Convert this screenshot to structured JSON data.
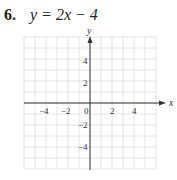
{
  "problem": {
    "number": "6.",
    "equation": "y = 2x − 4"
  },
  "chart_data": {
    "type": "line",
    "title": "y = 2x − 4",
    "xlabel": "x",
    "ylabel": "y",
    "xlim": [
      -6,
      6
    ],
    "ylim": [
      -6,
      6
    ],
    "grid": true,
    "x_ticks": [
      "−4",
      "−2",
      "0",
      "2",
      "4"
    ],
    "y_ticks": [
      "4",
      "2",
      "−2",
      "−4"
    ],
    "series": []
  }
}
